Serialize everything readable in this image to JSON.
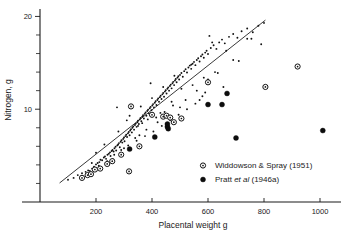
{
  "chart_data": {
    "type": "scatter",
    "title": "",
    "xlabel": "Placental weight g",
    "ylabel": "Nitrogen, g",
    "xlim": [
      0,
      1075
    ],
    "ylim": [
      0,
      20.8
    ],
    "xticks": [
      200,
      400,
      600,
      800,
      1000
    ],
    "xtick_labels": [
      "200",
      "400",
      "600",
      "800",
      "1000"
    ],
    "yticks": [
      10,
      20
    ],
    "ytick_labels": [
      "10",
      "20"
    ],
    "yminor_ticks": [
      2,
      4,
      6,
      8,
      12,
      14,
      16,
      18
    ],
    "grid": false,
    "legend_position": "lower-right",
    "legend": [
      {
        "label": "Widdowson & Spray (1951)",
        "marker": "open-circle"
      },
      {
        "label": "Pratt et al (1946a)",
        "marker": "filled-circle",
        "italic_part": "et al"
      }
    ],
    "fit_line": {
      "x": [
        70,
        805
      ],
      "y": [
        2.05,
        19.6
      ]
    },
    "series": [
      {
        "name": "background points",
        "marker": "small-dot",
        "points": [
          [
            150,
            3.1
          ],
          [
            163,
            3.25
          ],
          [
            172,
            3.4
          ],
          [
            178,
            3.35
          ],
          [
            186,
            3.6
          ],
          [
            193,
            3.8
          ],
          [
            200,
            4.05
          ],
          [
            206,
            4.2
          ],
          [
            212,
            4.3
          ],
          [
            216,
            4.55
          ],
          [
            222,
            4.5
          ],
          [
            228,
            4.8
          ],
          [
            232,
            4.9
          ],
          [
            236,
            4.65
          ],
          [
            241,
            5.1
          ],
          [
            246,
            5.2
          ],
          [
            250,
            5.35
          ],
          [
            252,
            4.95
          ],
          [
            256,
            5.5
          ],
          [
            259,
            5.6
          ],
          [
            263,
            5.45
          ],
          [
            266,
            5.8
          ],
          [
            270,
            5.95
          ],
          [
            272,
            5.55
          ],
          [
            276,
            6.1
          ],
          [
            279,
            6.2
          ],
          [
            282,
            6.35
          ],
          [
            285,
            5.9
          ],
          [
            288,
            6.5
          ],
          [
            291,
            6.65
          ],
          [
            294,
            6.4
          ],
          [
            297,
            6.8
          ],
          [
            300,
            6.95
          ],
          [
            302,
            6.55
          ],
          [
            305,
            7.1
          ],
          [
            308,
            7.25
          ],
          [
            311,
            7.0
          ],
          [
            314,
            7.4
          ],
          [
            317,
            7.55
          ],
          [
            320,
            7.2
          ],
          [
            322,
            7.7
          ],
          [
            325,
            7.85
          ],
          [
            328,
            7.5
          ],
          [
            330,
            8.0
          ],
          [
            333,
            8.15
          ],
          [
            336,
            7.8
          ],
          [
            339,
            8.3
          ],
          [
            342,
            8.45
          ],
          [
            345,
            8.1
          ],
          [
            348,
            8.6
          ],
          [
            350,
            8.75
          ],
          [
            353,
            8.4
          ],
          [
            356,
            8.9
          ],
          [
            359,
            9.05
          ],
          [
            362,
            8.7
          ],
          [
            365,
            9.2
          ],
          [
            368,
            9.35
          ],
          [
            371,
            9.0
          ],
          [
            374,
            9.5
          ],
          [
            377,
            9.65
          ],
          [
            380,
            9.3
          ],
          [
            383,
            9.8
          ],
          [
            386,
            9.95
          ],
          [
            389,
            9.55
          ],
          [
            392,
            10.1
          ],
          [
            395,
            10.25
          ],
          [
            398,
            9.9
          ],
          [
            401,
            10.4
          ],
          [
            404,
            10.55
          ],
          [
            407,
            10.2
          ],
          [
            410,
            10.7
          ],
          [
            413,
            10.85
          ],
          [
            416,
            10.45
          ],
          [
            419,
            11.0
          ],
          [
            422,
            11.15
          ],
          [
            425,
            10.8
          ],
          [
            428,
            11.3
          ],
          [
            431,
            11.45
          ],
          [
            434,
            11.1
          ],
          [
            437,
            11.6
          ],
          [
            440,
            11.75
          ],
          [
            443,
            11.35
          ],
          [
            446,
            11.9
          ],
          [
            449,
            12.05
          ],
          [
            452,
            11.7
          ],
          [
            455,
            12.2
          ],
          [
            458,
            12.35
          ],
          [
            461,
            12.0
          ],
          [
            464,
            12.5
          ],
          [
            467,
            12.65
          ],
          [
            470,
            12.25
          ],
          [
            473,
            12.8
          ],
          [
            476,
            12.95
          ],
          [
            479,
            12.6
          ],
          [
            482,
            13.1
          ],
          [
            485,
            13.25
          ],
          [
            488,
            12.9
          ],
          [
            491,
            13.4
          ],
          [
            494,
            13.55
          ],
          [
            497,
            13.2
          ],
          [
            500,
            13.7
          ],
          [
            505,
            13.9
          ],
          [
            510,
            13.5
          ],
          [
            515,
            14.1
          ],
          [
            520,
            14.3
          ],
          [
            525,
            13.95
          ],
          [
            530,
            14.5
          ],
          [
            535,
            14.7
          ],
          [
            540,
            14.35
          ],
          [
            545,
            14.9
          ],
          [
            550,
            15.1
          ],
          [
            555,
            14.75
          ],
          [
            560,
            15.3
          ],
          [
            565,
            15.5
          ],
          [
            570,
            15.15
          ],
          [
            575,
            15.7
          ],
          [
            580,
            15.9
          ],
          [
            585,
            15.55
          ],
          [
            590,
            16.1
          ],
          [
            595,
            16.3
          ],
          [
            600,
            15.95
          ],
          [
            610,
            16.6
          ],
          [
            620,
            16.9
          ],
          [
            630,
            16.5
          ],
          [
            640,
            17.2
          ],
          [
            650,
            17.5
          ],
          [
            660,
            17.1
          ],
          [
            675,
            17.8
          ],
          [
            690,
            18.1
          ],
          [
            705,
            17.7
          ],
          [
            720,
            18.4
          ],
          [
            740,
            18.7
          ],
          [
            760,
            18.3
          ],
          [
            780,
            19.0
          ],
          [
            800,
            19.3
          ],
          [
            200,
            5.3
          ],
          [
            230,
            6.2
          ],
          [
            260,
            4.6
          ],
          [
            280,
            7.6
          ],
          [
            300,
            5.8
          ],
          [
            320,
            9.3
          ],
          [
            340,
            6.9
          ],
          [
            360,
            10.3
          ],
          [
            380,
            7.8
          ],
          [
            400,
            11.2
          ],
          [
            420,
            8.6
          ],
          [
            440,
            12.4
          ],
          [
            460,
            9.2
          ],
          [
            480,
            13.6
          ],
          [
            500,
            10.2
          ],
          [
            520,
            11.0
          ],
          [
            540,
            14.8
          ],
          [
            560,
            12.0
          ],
          [
            580,
            11.4
          ],
          [
            600,
            13.2
          ],
          [
            275,
            10.2
          ],
          [
            310,
            8.8
          ],
          [
            355,
            7.2
          ],
          [
            395,
            12.8
          ],
          [
            430,
            9.6
          ],
          [
            470,
            10.8
          ],
          [
            505,
            12.2
          ],
          [
            545,
            12.6
          ],
          [
            585,
            13.4
          ],
          [
            625,
            14.0
          ],
          [
            605,
            17.9
          ],
          [
            615,
            17.2
          ],
          [
            665,
            16.3
          ],
          [
            690,
            15.3
          ],
          [
            710,
            15.2
          ],
          [
            740,
            17.6
          ],
          [
            755,
            17.6
          ],
          [
            790,
            17.0
          ],
          [
            635,
            13.9
          ],
          [
            655,
            12.4
          ],
          [
            590,
            11.8
          ],
          [
            570,
            11.0
          ],
          [
            185,
            4.2
          ],
          [
            210,
            3.9
          ],
          [
            240,
            4.4
          ],
          [
            265,
            5.1
          ],
          [
            290,
            5.6
          ],
          [
            315,
            6.1
          ],
          [
            345,
            6.6
          ],
          [
            375,
            7.1
          ],
          [
            405,
            7.6
          ],
          [
            435,
            8.2
          ],
          [
            465,
            8.8
          ],
          [
            495,
            9.4
          ],
          [
            525,
            10.0
          ],
          [
            555,
            10.6
          ],
          [
            350,
            8.2
          ],
          [
            365,
            8.5
          ],
          [
            385,
            8.9
          ],
          [
            415,
            9.1
          ],
          [
            445,
            9.7
          ],
          [
            475,
            10.4
          ],
          [
            100,
            2.4
          ],
          [
            120,
            2.6
          ],
          [
            135,
            2.9
          ]
        ]
      },
      {
        "name": "Widdowson & Spray (1951)",
        "marker": "open-circle",
        "points": [
          [
            150,
            2.6
          ],
          [
            170,
            2.9
          ],
          [
            182,
            3.0
          ],
          [
            196,
            3.5
          ],
          [
            215,
            3.6
          ],
          [
            240,
            4.1
          ],
          [
            258,
            4.4
          ],
          [
            290,
            5.1
          ],
          [
            318,
            3.3
          ],
          [
            325,
            10.3
          ],
          [
            355,
            6.0
          ],
          [
            400,
            9.4
          ],
          [
            440,
            9.2
          ],
          [
            452,
            9.3
          ],
          [
            465,
            9.1
          ],
          [
            478,
            8.6
          ],
          [
            505,
            9.0
          ],
          [
            600,
            12.9
          ],
          [
            805,
            12.4
          ],
          [
            920,
            14.6
          ]
        ]
      },
      {
        "name": "Pratt et al (1946a)",
        "marker": "filled-circle",
        "points": [
          [
            320,
            5.7
          ],
          [
            410,
            7.0
          ],
          [
            455,
            8.4
          ],
          [
            455,
            8.1
          ],
          [
            458,
            7.9
          ],
          [
            600,
            10.5
          ],
          [
            650,
            10.5
          ],
          [
            668,
            11.7
          ],
          [
            700,
            6.9
          ],
          [
            1010,
            7.7
          ]
        ]
      }
    ]
  },
  "axes": {
    "x_title": "Placental weight g",
    "y_title": "Nitrogen, g"
  }
}
